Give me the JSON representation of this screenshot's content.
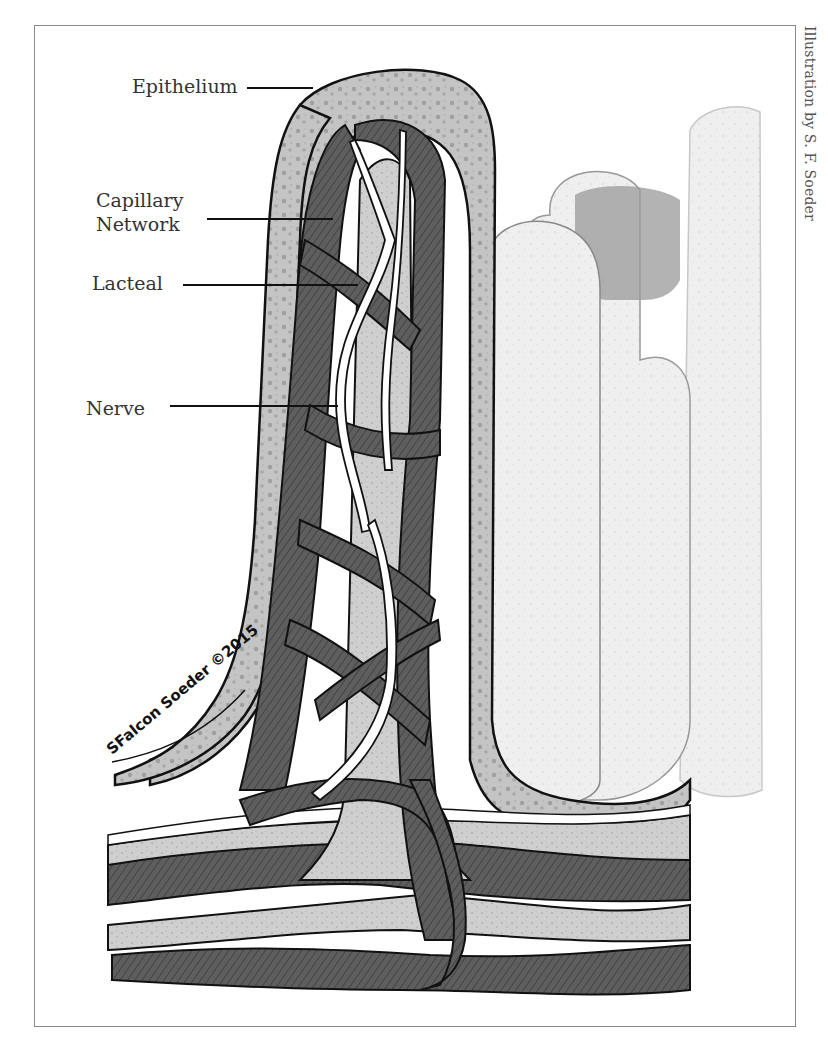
{
  "figure": {
    "credit": "Illustration by S. F. Soeder",
    "signature": "SFalcon Soeder ©2015",
    "labels": [
      {
        "id": "epithelium",
        "text": "Epithelium"
      },
      {
        "id": "capillary-network",
        "text_line1": "Capillary",
        "text_line2": "Network"
      },
      {
        "id": "lacteal",
        "text": "Lacteal"
      },
      {
        "id": "nerve",
        "text": "Nerve"
      }
    ],
    "palette": {
      "outline": "#111111",
      "capillary": "#5a5a5a",
      "lacteal": "#c9c9c9",
      "epithelium": "#bdbdbd",
      "background_villus": "#e8e8e8",
      "nerve": "#ffffff"
    }
  }
}
